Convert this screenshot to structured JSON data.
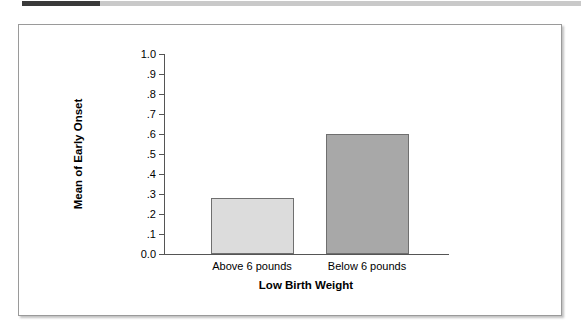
{
  "top_rule": {
    "accent_color": "#3a3a3a",
    "rule_color": "#c9c9c9"
  },
  "chart_data": {
    "type": "bar",
    "title": "",
    "subtitle": "",
    "categories": [
      "Above 6 pounds",
      "Below 6 pounds"
    ],
    "values": [
      0.28,
      0.6
    ],
    "series": [
      {
        "name": "Mean of Early Onset",
        "values": [
          0.28,
          0.6
        ]
      }
    ],
    "xlabel": "Low Birth Weight",
    "ylabel": "Mean of Early Onset",
    "ylim": [
      0.0,
      1.0
    ],
    "ytick_labels": [
      "1.0",
      ".9",
      ".8",
      ".7",
      ".6",
      ".5",
      ".4",
      ".3",
      ".2",
      ".1",
      "0.0"
    ],
    "ytick_values": [
      1.0,
      0.9,
      0.8,
      0.7,
      0.6,
      0.5,
      0.4,
      0.3,
      0.2,
      0.1,
      0.0
    ],
    "bar_colors": [
      "#dcdcdc",
      "#a8a8a8"
    ],
    "bar_border_color": "#6f6f6f",
    "axis_color": "#555555",
    "grid": false,
    "legend": "none"
  }
}
